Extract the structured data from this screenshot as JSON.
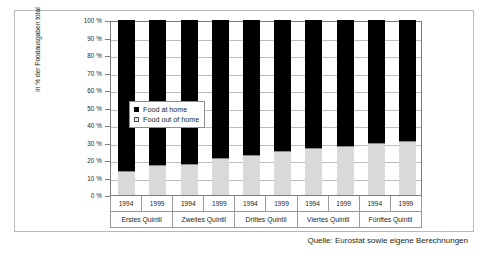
{
  "chart_data": {
    "type": "bar",
    "subtype": "stacked-100-percent",
    "title": "",
    "xlabel": "",
    "ylabel": "in % der Foodausgaben total",
    "ylim": [
      0,
      100
    ],
    "ytick_labels": [
      "100 %",
      "90 %",
      "80 %",
      "70 %",
      "60 %",
      "50 %",
      "40 %",
      "30 %",
      "20 %",
      "10 %",
      "0 %"
    ],
    "ytick_values": [
      100,
      90,
      80,
      70,
      60,
      50,
      40,
      30,
      20,
      10,
      0
    ],
    "grid": true,
    "legend_position": "inside-left-middle",
    "categories": [
      "1994",
      "1999",
      "1994",
      "1999",
      "1994",
      "1999",
      "1994",
      "1999",
      "1994",
      "1999"
    ],
    "groups": [
      {
        "label": "Erstes Quintil",
        "years": [
          "1994",
          "1999"
        ]
      },
      {
        "label": "Zweites Quintil",
        "years": [
          "1994",
          "1999"
        ]
      },
      {
        "label": "Drittes Quintil",
        "years": [
          "1994",
          "1999"
        ]
      },
      {
        "label": "Viertes Quintil",
        "years": [
          "1994",
          "1999"
        ]
      },
      {
        "label": "Fünftes Quintil",
        "years": [
          "1994",
          "1999"
        ]
      }
    ],
    "series": [
      {
        "name": "Food out of home",
        "color": "#d9d9d9",
        "values": [
          14,
          17,
          18,
          21,
          23,
          25,
          27,
          28,
          30,
          31
        ]
      },
      {
        "name": "Food at home",
        "color": "#000000",
        "values": [
          86,
          83,
          82,
          79,
          77,
          75,
          73,
          72,
          70,
          69
        ]
      }
    ]
  },
  "legend": {
    "items": [
      {
        "label": "Food at home",
        "swatch": "black-square"
      },
      {
        "label": "Food out of home",
        "swatch": "white-square"
      }
    ]
  },
  "axis": {
    "y_title": "in % der Foodausgaben total",
    "y_ticks": [
      "100 %",
      "90 %",
      "80 %",
      "70 %",
      "60 %",
      "50 %",
      "40 %",
      "30 %",
      "20 %",
      "10 %",
      "0 %"
    ]
  },
  "footer": {
    "source": "Quelle: Eurostat sowie eigene Berechnungen"
  }
}
